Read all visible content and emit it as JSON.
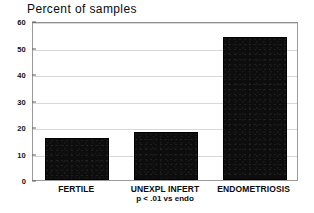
{
  "chart_data": {
    "type": "bar",
    "title": "Percent of samples",
    "xlabel": "",
    "ylabel": "",
    "categories": [
      "FERTILE",
      "UNEXPL INFERT",
      "ENDOMETRIOSIS"
    ],
    "values": [
      16,
      18,
      54
    ],
    "ylim": [
      0,
      60
    ],
    "yticks": [
      0,
      10,
      20,
      30,
      40,
      50,
      60
    ],
    "ytick_labels": [
      "0",
      "10",
      "20",
      "30",
      "40",
      "50",
      "60"
    ],
    "grid": true,
    "legend": null,
    "annotations": [
      {
        "text": "p < .01 vs endo",
        "position": "below-category-2"
      }
    ],
    "colors": {
      "bar": "#0d0d0d",
      "frame": "#9a9a9a",
      "grid": "#d8d8d8",
      "text": "#0a0a0a",
      "background": "#ffffff"
    }
  }
}
